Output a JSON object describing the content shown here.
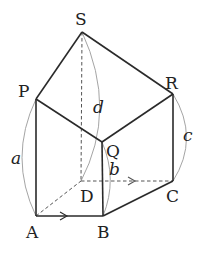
{
  "diagram": {
    "type": "3d-solid-with-vectors",
    "vertices": [
      {
        "id": "S",
        "label": "S",
        "x": 82,
        "y": 32,
        "lx": 75,
        "ly": 25
      },
      {
        "id": "P",
        "label": "P",
        "x": 36,
        "y": 99,
        "lx": 18,
        "ly": 97
      },
      {
        "id": "R",
        "label": "R",
        "x": 173,
        "y": 94,
        "lx": 164,
        "ly": 88
      },
      {
        "id": "Q",
        "label": "Q",
        "x": 102,
        "y": 142,
        "lx": 106,
        "ly": 155
      },
      {
        "id": "D",
        "label": "D",
        "x": 81,
        "y": 181,
        "lx": 80,
        "ly": 202
      },
      {
        "id": "C",
        "label": "C",
        "x": 173,
        "y": 181,
        "lx": 166,
        "ly": 202
      },
      {
        "id": "A",
        "label": "A",
        "x": 36,
        "y": 216,
        "lx": 26,
        "ly": 238
      },
      {
        "id": "B",
        "label": "B",
        "x": 103,
        "y": 216,
        "lx": 96,
        "ly": 238
      }
    ],
    "solid_edges": [
      [
        "S",
        "P"
      ],
      [
        "S",
        "R"
      ],
      [
        "P",
        "Q"
      ],
      [
        "Q",
        "R"
      ],
      [
        "P",
        "A"
      ],
      [
        "Q",
        "B"
      ],
      [
        "R",
        "C"
      ],
      [
        "A",
        "B"
      ],
      [
        "B",
        "C"
      ]
    ],
    "dashed_edges": [
      [
        "S",
        "D"
      ],
      [
        "A",
        "D"
      ],
      [
        "D",
        "C"
      ]
    ],
    "arrows": [
      {
        "on": "AB",
        "direction": "right"
      },
      {
        "on": "DC",
        "direction": "right"
      }
    ],
    "arc_labels": [
      {
        "name": "a",
        "text": "a",
        "from": "P",
        "to": "A"
      },
      {
        "name": "b",
        "text": "b",
        "from": "Q",
        "to": "B"
      },
      {
        "name": "c",
        "text": "c",
        "from": "R",
        "to": "C"
      },
      {
        "name": "d",
        "text": "d",
        "from": "S",
        "to": "D"
      }
    ],
    "colors": {
      "edge": "#2a2a2a",
      "dash": "#555555",
      "arc": "#9a9a9a",
      "text": "#222222"
    }
  },
  "labels": {
    "S": "S",
    "P": "P",
    "R": "R",
    "Q": "Q",
    "D": "D",
    "C": "C",
    "A": "A",
    "B": "B",
    "a": "a",
    "b": "b",
    "c": "c",
    "d": "d"
  }
}
